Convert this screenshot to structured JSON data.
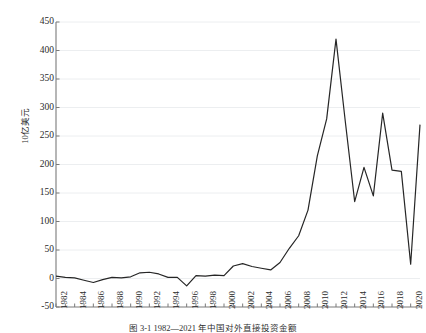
{
  "figure": {
    "caption": "图 3-1  1982—2021 年中国对外直接投资金额"
  },
  "chart_data": {
    "type": "line",
    "title": "",
    "subtitle": "",
    "xlabel": "",
    "ylabel": "10亿美元",
    "legend": [],
    "legend_position": "none",
    "grid": true,
    "grid_axis": "y",
    "xlim": [
      1982,
      2021
    ],
    "ylim": [
      -50,
      450
    ],
    "yticks": [
      450,
      400,
      350,
      300,
      250,
      200,
      150,
      100,
      50,
      0,
      -50
    ],
    "ytick_labels": [
      "450",
      "400",
      "350",
      "300",
      "250",
      "200",
      "150",
      "100",
      "50",
      "0",
      "-50"
    ],
    "xticks": [
      1982,
      1984,
      1986,
      1988,
      1990,
      1992,
      1994,
      1996,
      1998,
      2000,
      2002,
      2004,
      2006,
      2008,
      2010,
      2012,
      2014,
      2016,
      2018,
      2020
    ],
    "xtick_labels": [
      "1982",
      "1984",
      "1986",
      "1988",
      "1990",
      "1992",
      "1994",
      "1996",
      "1998",
      "2000",
      "2002",
      "2004",
      "2006",
      "2008",
      "2010",
      "2012",
      "2014",
      "2016",
      "2018",
      "2020"
    ],
    "xtick_minor_every": 1,
    "line_color": "#262626",
    "line_width": 1.2,
    "series": [
      {
        "name": "对外直接投资",
        "x": [
          1982,
          1983,
          1984,
          1985,
          1986,
          1987,
          1988,
          1989,
          1990,
          1991,
          1992,
          1993,
          1994,
          1995,
          1996,
          1997,
          1998,
          1999,
          2000,
          2001,
          2002,
          2003,
          2004,
          2005,
          2006,
          2007,
          2008,
          2009,
          2010,
          2011,
          2012,
          2013,
          2014,
          2015,
          2016,
          2017,
          2018,
          2019,
          2020,
          2021
        ],
        "values": [
          4,
          2,
          1,
          -3,
          -7,
          -2,
          2,
          1,
          3,
          10,
          11,
          8,
          2,
          2,
          -13,
          5,
          4,
          6,
          5,
          22,
          26,
          21,
          18,
          15,
          28,
          53,
          75,
          120,
          215,
          280,
          420,
          275,
          135,
          195,
          145,
          290,
          190,
          188,
          25,
          270
        ]
      }
    ]
  }
}
